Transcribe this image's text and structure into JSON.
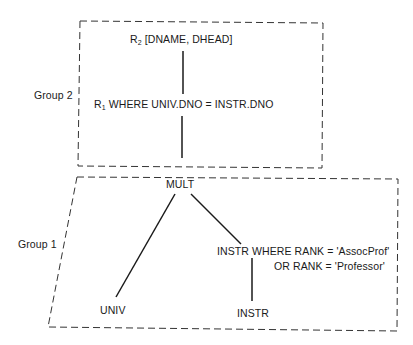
{
  "groups": [
    {
      "label": "Group 2"
    },
    {
      "label": "Group 1"
    }
  ],
  "nodes": {
    "r2": {
      "base": "R",
      "sub": "2",
      "text": "[DNAME, DHEAD]"
    },
    "r1": {
      "base": "R",
      "sub": "1",
      "text": "WHERE UNIV.DNO = INSTR.DNO"
    },
    "mult": {
      "text": "MULT"
    },
    "select_line1": {
      "text": "INSTR WHERE RANK = 'AssocProf'"
    },
    "select_line2": {
      "text": "OR RANK = 'Professor'"
    },
    "univ": {
      "text": "UNIV"
    },
    "instr": {
      "text": "INSTR"
    }
  },
  "colors": {
    "ink": "#1a1a1a",
    "dash": "#333333",
    "background": "#ffffff"
  }
}
